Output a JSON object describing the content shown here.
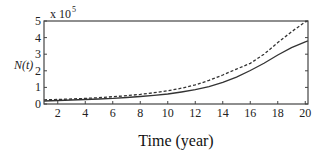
{
  "chart_data": {
    "type": "line",
    "title": "",
    "xlabel": "Time (year)",
    "ylabel": "N(t)",
    "y_multiplier": "x 10",
    "y_multiplier_exp": "5",
    "xlim": [
      1,
      20.2
    ],
    "ylim": [
      0,
      5
    ],
    "x_ticks": [
      2,
      4,
      6,
      8,
      10,
      12,
      14,
      16,
      18,
      20
    ],
    "y_ticks": [
      0,
      1,
      2,
      3,
      4,
      5
    ],
    "grid": false,
    "legend": null,
    "x": [
      1,
      2,
      3,
      4,
      5,
      6,
      7,
      8,
      9,
      10,
      11,
      12,
      13,
      14,
      15,
      16,
      17,
      18,
      19,
      20,
      20.2
    ],
    "series": [
      {
        "name": "solid",
        "style": "solid",
        "color": "#333333",
        "values": [
          0.18,
          0.21,
          0.24,
          0.27,
          0.3,
          0.34,
          0.39,
          0.45,
          0.52,
          0.6,
          0.72,
          0.86,
          1.05,
          1.3,
          1.62,
          2.02,
          2.45,
          2.95,
          3.4,
          3.75,
          3.8
        ]
      },
      {
        "name": "dashed",
        "style": "dashed",
        "color": "#333333",
        "values": [
          0.25,
          0.27,
          0.3,
          0.34,
          0.38,
          0.44,
          0.5,
          0.58,
          0.68,
          0.8,
          0.95,
          1.15,
          1.42,
          1.75,
          2.1,
          2.45,
          3.0,
          3.7,
          4.35,
          4.95,
          5.0
        ]
      }
    ]
  }
}
